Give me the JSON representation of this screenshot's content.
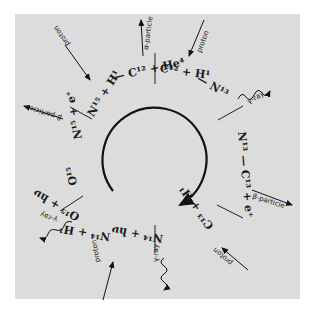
{
  "diagram": {
    "steps": [
      {
        "reaction": "C¹² + H¹",
        "emits": "proton",
        "type": "input"
      },
      {
        "reaction": "N¹³ + hν",
        "emits": "γ-ray",
        "type": "output"
      },
      {
        "reaction": "N¹³ — C¹³ + e⁺",
        "emits": "β-particle",
        "type": "output"
      },
      {
        "reaction": "C¹³ + H¹",
        "emits": "proton",
        "type": "input"
      },
      {
        "reaction": "N¹⁴ + hν",
        "emits": "γ-ray",
        "type": "output"
      },
      {
        "reaction": "N¹⁴ + H¹",
        "emits": "proton",
        "type": "input"
      },
      {
        "reaction": "O¹⁵ + hν",
        "emits": "γ-ray",
        "type": "output"
      },
      {
        "reaction": "O¹⁵ — N¹⁵ + e⁺",
        "emits": "β-particle",
        "type": "output"
      },
      {
        "reaction": "N¹⁵ + H¹",
        "emits": "proton",
        "type": "input"
      },
      {
        "reaction": "C¹² + He⁴",
        "emits": "α-particle",
        "type": "output"
      }
    ],
    "labels": {
      "c12_h1": "C¹² + H¹",
      "n13_arrow": "— N¹³",
      "n13_hv": "N¹³ + hν",
      "n13_c13": "N¹³ — C¹³ + e⁺",
      "c13_h1": "C¹³ + H¹",
      "n14_from_c13": "N¹⁴ —",
      "n14_hv": "N¹⁴ + hν",
      "n14_h1": "N¹⁴ + H¹",
      "o15_from_n14": "— O¹⁵",
      "o15_hv": "O¹⁵ + hν",
      "o15": "O¹⁵",
      "n15_e": "N¹⁵ + e⁺",
      "n15_h1": "N¹⁵ + H¹",
      "c12_he4": "— C¹² + He⁴",
      "proton": "proton",
      "gamma_ray": "γ-ray",
      "beta_particle": "β-particle",
      "alpha_particle": "α-particle"
    },
    "center_arrow": "cycle-direction"
  }
}
